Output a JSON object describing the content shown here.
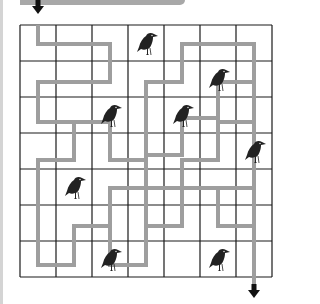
{
  "puzzle": {
    "type": "maze",
    "title": "",
    "grid": {
      "cols": 7,
      "rows": 7,
      "left": 20,
      "top": 25,
      "cell": 36
    },
    "colors": {
      "grid_line": "#1a1a1a",
      "path": "#9e9e9e",
      "arrow": "#111111",
      "crow": "#222222"
    },
    "start_arrow": {
      "x": 38,
      "y": 8,
      "direction": "down",
      "label": "start"
    },
    "end_arrow": {
      "x": 254,
      "y": 292,
      "direction": "down",
      "label": "finish"
    },
    "crows": [
      {
        "col": 3,
        "row": 0
      },
      {
        "col": 5,
        "row": 1
      },
      {
        "col": 2,
        "row": 2
      },
      {
        "col": 4,
        "row": 2
      },
      {
        "col": 6,
        "row": 3
      },
      {
        "col": 1,
        "row": 4
      },
      {
        "col": 2,
        "row": 6
      },
      {
        "col": 5,
        "row": 6
      }
    ],
    "paths": [
      "38,25 38,44 110,44 110,82 38,82 38,122 74,122 74,160 38,160 38,265 74,265 74,226 110,226 110,188 146,188 146,155",
      "146,155 146,82 182,82 182,44 254,44 254,122 218,122 218,160 182,160 182,188 146,188",
      "146,155 182,155 182,118 218,118 218,82 254,82",
      "254,122 254,290",
      "110,226 110,265 146,265 146,226 182,226 182,188 218,188 218,226 254,226",
      "146,265 146,160 110,160 110,122 74,122",
      "218,226 218,188 254,188"
    ]
  }
}
